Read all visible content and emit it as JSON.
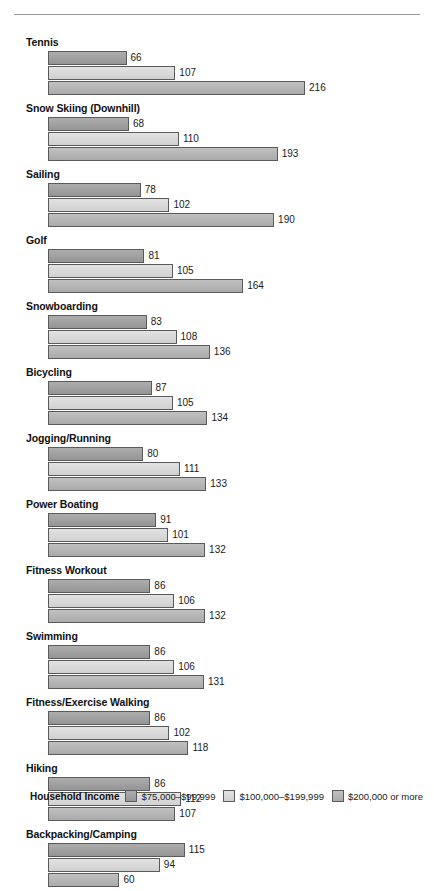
{
  "chart_data": {
    "type": "bar",
    "orientation": "horizontal",
    "title": "",
    "subtitle": "",
    "xlabel": "",
    "ylabel": "",
    "grid": false,
    "legend_position": "bottom",
    "legend_title": "Household Income",
    "axis_origin_value": 0,
    "px_per_unit": 1.19,
    "categories": [
      "Tennis",
      "Snow Skiing (Downhill)",
      "Sailing",
      "Golf",
      "Snowboarding",
      "Bicycling",
      "Jogging/Running",
      "Power Boating",
      "Fitness Workout",
      "Swimming",
      "Fitness/Exercise Walking",
      "Hiking",
      "Backpacking/Camping"
    ],
    "series": [
      {
        "name": "$75,000–$99,999",
        "color": "#9d9d9d",
        "values": [
          66,
          68,
          78,
          81,
          83,
          87,
          80,
          91,
          86,
          86,
          86,
          86,
          115
        ]
      },
      {
        "name": "$100,000–$199,999",
        "color": "#dcdcdc",
        "values": [
          107,
          110,
          102,
          105,
          108,
          105,
          111,
          101,
          106,
          106,
          102,
          112,
          94
        ]
      },
      {
        "name": "$200,000 or more",
        "color": "#b4b4b4",
        "values": [
          216,
          193,
          190,
          164,
          136,
          134,
          133,
          132,
          132,
          131,
          118,
          107,
          60
        ]
      }
    ]
  },
  "legend": {
    "title": "Household Income",
    "items": [
      {
        "label": "$75,000–$99,999",
        "color": "#9d9d9d"
      },
      {
        "label": "$100,000–$199,999",
        "color": "#dcdcdc"
      },
      {
        "label": "$200,000 or more",
        "color": "#b4b4b4"
      }
    ]
  }
}
